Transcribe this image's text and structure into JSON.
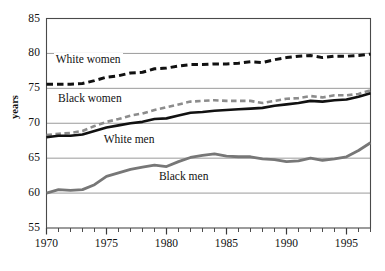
{
  "chart_data": {
    "type": "line",
    "title": "",
    "subtitle": "",
    "xlabel": "",
    "ylabel": "years",
    "xlim": [
      1970,
      1997
    ],
    "ylim": [
      55,
      85
    ],
    "grid": true,
    "legend_position": "inline-annotations",
    "y_ticks": [
      55,
      60,
      65,
      70,
      75,
      80,
      85
    ],
    "y_tick_labels": [
      "55",
      "60",
      "65",
      "70",
      "75",
      "80",
      "85"
    ],
    "x_ticks": [
      1970,
      1975,
      1980,
      1985,
      1990,
      1995
    ],
    "x_tick_labels": [
      "1970",
      "1975",
      "1980",
      "1985",
      "1990",
      "1995"
    ],
    "x_minor_tick_step": 1,
    "x": [
      1970,
      1971,
      1972,
      1973,
      1974,
      1975,
      1976,
      1977,
      1978,
      1979,
      1980,
      1981,
      1982,
      1983,
      1984,
      1985,
      1986,
      1987,
      1988,
      1989,
      1990,
      1991,
      1992,
      1993,
      1994,
      1995,
      1996,
      1997
    ],
    "series": [
      {
        "name": "White women",
        "style": "dashed",
        "color": "#111111",
        "width": 3.0,
        "values": [
          75.6,
          75.6,
          75.6,
          75.7,
          76.1,
          76.6,
          76.8,
          77.2,
          77.3,
          77.8,
          77.9,
          78.2,
          78.4,
          78.4,
          78.5,
          78.5,
          78.6,
          78.8,
          78.7,
          79.1,
          79.4,
          79.6,
          79.7,
          79.4,
          79.6,
          79.6,
          79.7,
          79.9
        ]
      },
      {
        "name": "Black women",
        "style": "dashed",
        "color": "#8c8c8c",
        "width": 2.6,
        "values": [
          68.3,
          68.5,
          68.6,
          68.9,
          69.6,
          70.2,
          70.6,
          71.1,
          71.4,
          71.9,
          72.3,
          72.7,
          73.1,
          73.2,
          73.3,
          73.2,
          73.2,
          73.2,
          72.9,
          73.2,
          73.5,
          73.6,
          73.9,
          73.7,
          74.0,
          74.0,
          74.2,
          74.7
        ]
      },
      {
        "name": "White men",
        "style": "solid",
        "color": "#111111",
        "width": 2.6,
        "values": [
          68.0,
          68.2,
          68.2,
          68.4,
          68.9,
          69.4,
          69.7,
          70.0,
          70.2,
          70.6,
          70.7,
          71.1,
          71.5,
          71.6,
          71.8,
          71.9,
          72.0,
          72.1,
          72.2,
          72.5,
          72.7,
          72.9,
          73.2,
          73.1,
          73.3,
          73.4,
          73.8,
          74.3
        ]
      },
      {
        "name": "Black men",
        "style": "solid",
        "color": "#777777",
        "width": 2.8,
        "values": [
          60.0,
          60.5,
          60.4,
          60.5,
          61.2,
          62.4,
          62.9,
          63.4,
          63.7,
          64.0,
          63.8,
          64.5,
          65.1,
          65.4,
          65.6,
          65.3,
          65.2,
          65.2,
          64.9,
          64.8,
          64.5,
          64.6,
          65.0,
          64.7,
          64.9,
          65.2,
          66.1,
          67.2
        ]
      }
    ],
    "annotations": [
      {
        "text": "White women",
        "x": 1970.6,
        "y": 78.9
      },
      {
        "text": "Black women",
        "x": 1970.8,
        "y": 73.3
      },
      {
        "text": "White men",
        "x": 1974.6,
        "y": 67.4
      },
      {
        "text": "Black men",
        "x": 1979.2,
        "y": 62.1
      }
    ]
  }
}
